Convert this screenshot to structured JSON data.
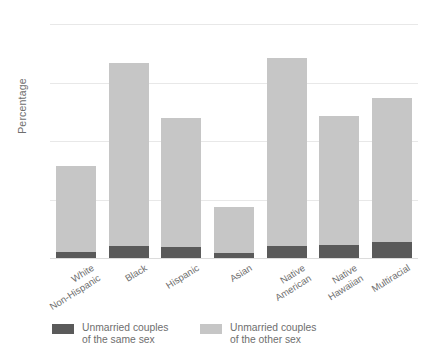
{
  "chart_data": {
    "type": "bar",
    "stacked": true,
    "title": "",
    "subtitle": "",
    "xlabel": "",
    "ylabel": "Percentage",
    "ylim": [
      0,
      20
    ],
    "yticks": [
      0,
      5,
      10,
      15,
      20
    ],
    "ytick_labels": [
      "0",
      "5",
      "10",
      "15",
      "20"
    ],
    "grid": true,
    "legend_position": "bottom-left",
    "categories": [
      "White\nNon-Hispanic",
      "Black",
      "Hispanic",
      "Asian",
      "Native\nAmerican",
      "Native\nHawaiian",
      "Multiracial"
    ],
    "category_lines": [
      [
        "White",
        "Non-Hispanic"
      ],
      [
        "Black"
      ],
      [
        "Hispanic"
      ],
      [
        "Asian"
      ],
      [
        "Native",
        "American"
      ],
      [
        "Native",
        "Hawaiian"
      ],
      [
        "Multiracial"
      ]
    ],
    "series": [
      {
        "name": "Unmarried couples of the same sex",
        "name_lines": [
          "Unmarried couples",
          "of the same sex"
        ],
        "color": "#5a5a5a",
        "values": [
          0.5,
          1.0,
          0.9,
          0.4,
          1.0,
          1.1,
          1.4
        ]
      },
      {
        "name": "Unmarried couples of the other sex",
        "name_lines": [
          "Unmarried couples",
          "of the other sex"
        ],
        "color": "#c6c6c6",
        "values": [
          7.4,
          15.7,
          11.1,
          4.0,
          16.1,
          11.0,
          12.3
        ]
      }
    ],
    "totals": [
      7.9,
      16.7,
      12.0,
      4.4,
      17.1,
      12.1,
      13.7
    ]
  },
  "colors": {
    "same_sex": "#5a5a5a",
    "other_sex": "#c6c6c6",
    "gridline": "#e8e8e8",
    "text": "#6e6e6e",
    "background": "#ffffff"
  }
}
